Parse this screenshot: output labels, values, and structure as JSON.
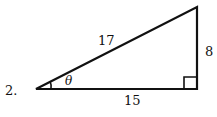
{
  "problem_number": "2.",
  "triangle": {
    "hypotenuse": "17",
    "opposite": "8",
    "adjacent": "15",
    "angle_label": "θ",
    "right_angle": true
  },
  "colors": {
    "stroke": "#111111",
    "background": "#ffffff"
  }
}
